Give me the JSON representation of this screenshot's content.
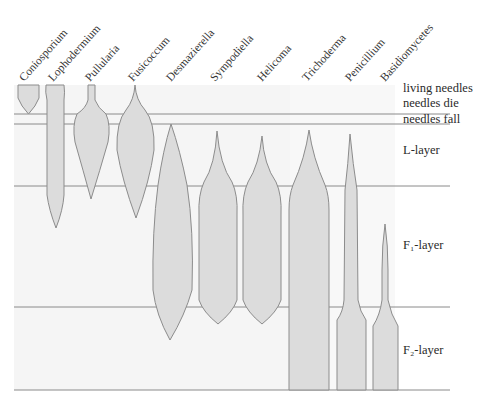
{
  "diagram": {
    "genera": [
      {
        "name": "Coniosporium",
        "label_x": 27
      },
      {
        "name": "Lophodermium",
        "label_x": 55
      },
      {
        "name": "Pullularia",
        "label_x": 92
      },
      {
        "name": "Fusicoccum",
        "label_x": 135
      },
      {
        "name": "Desmazierella",
        "label_x": 172
      },
      {
        "name": "Sympodiella",
        "label_x": 215
      },
      {
        "name": "Helicoma",
        "label_x": 262
      },
      {
        "name": "Trichoderma",
        "label_x": 306
      },
      {
        "name": "Penicillium",
        "label_x": 351
      },
      {
        "name": "Basidiomycetes",
        "label_x": 387
      }
    ],
    "stages": [
      {
        "name": "living needles",
        "y": 92
      },
      {
        "name": "needles die",
        "y": 107
      },
      {
        "name": "needles fall",
        "y": 123
      }
    ],
    "layers": [
      {
        "name": "L-layer",
        "y": 154
      },
      {
        "name": "F₁-layer",
        "y": 249
      },
      {
        "name": "F₂-layer",
        "y": 354
      }
    ],
    "colors": {
      "shape_fill": "#dcdcdc",
      "shape_stroke": "#8c8c8c",
      "panel_bg": "#f4f4f4",
      "line": "#8a8a8a"
    }
  }
}
